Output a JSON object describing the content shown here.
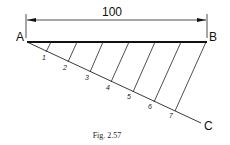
{
  "figure": {
    "caption": "Fig. 2.57",
    "dimension_label": "100",
    "points": {
      "a": "A",
      "b": "B",
      "c": "C"
    },
    "divisions": [
      "1",
      "2",
      "3",
      "4",
      "5",
      "6",
      "7"
    ]
  }
}
